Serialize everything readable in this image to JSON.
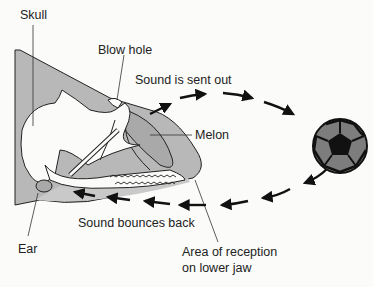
{
  "diagram": {
    "type": "echolocation",
    "labels": {
      "skull": "Skull",
      "blow_hole": "Blow hole",
      "sound_out": "Sound is sent out",
      "melon": "Melon",
      "bounces_back": "Sound bounces back",
      "ear": "Ear",
      "reception_line1": "Area of reception",
      "reception_line2": "on lower jaw"
    },
    "target_object": "soccer-ball",
    "colors": {
      "background": "#fbfbf9",
      "head_fill": "#b8b8b8",
      "melon_fill": "#a9a9a9",
      "line": "#222222",
      "ball_dark": "#111111",
      "ball_panel": "#7d7d7d"
    }
  }
}
